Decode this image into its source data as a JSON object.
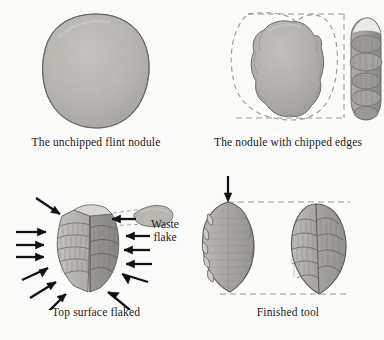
{
  "figure": {
    "background_color": "#fbfbfa",
    "stone_fill": "#b6b4af",
    "stone_fill_dark": "#8e8c87",
    "stone_fill_light": "#cfcdc8",
    "outline_color": "#6e6c68",
    "arrow_color": "#111111",
    "dash_color": "#9a9893",
    "text_color": "#1a1a1a"
  },
  "panels": [
    {
      "id": "nodule",
      "caption": "The unchipped flint nodule",
      "views": 1,
      "arrows": 0,
      "dashed_outline": false
    },
    {
      "id": "chipped",
      "caption": "The nodule with chipped edges",
      "views": 2,
      "arrows": 4,
      "dashed_outline": true
    },
    {
      "id": "topflaked",
      "caption": "Top surface flaked",
      "views": 1,
      "arrows": 13,
      "dashed_outline": true,
      "inline_label": "Waste\nflake",
      "inline_label_line1": "Waste",
      "inline_label_line2": "flake"
    },
    {
      "id": "finished",
      "caption": "Finished tool",
      "views": 2,
      "arrows": 1,
      "dashed_outline": true
    }
  ]
}
